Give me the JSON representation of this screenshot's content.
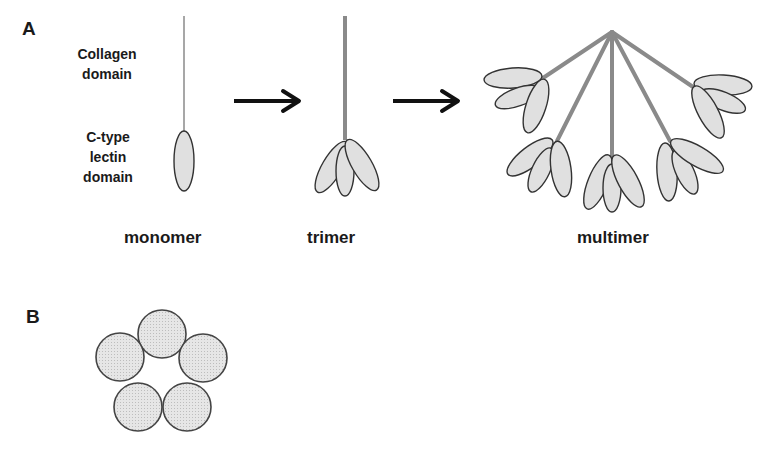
{
  "panels": {
    "a": {
      "label": "A",
      "domain_labels": {
        "collagen": [
          "Collagen",
          "domain"
        ],
        "lectin": [
          "C-type",
          "lectin",
          "domain"
        ]
      },
      "states": {
        "monomer": "monomer",
        "trimer": "trimer",
        "multimer": "multimer"
      }
    },
    "b": {
      "label": "B",
      "circle_count": 5
    }
  },
  "colors": {
    "stalk": "#8a8a8a",
    "lobe_fill": "#e0e0e0",
    "outline": "#333333",
    "arrow": "#111111"
  }
}
